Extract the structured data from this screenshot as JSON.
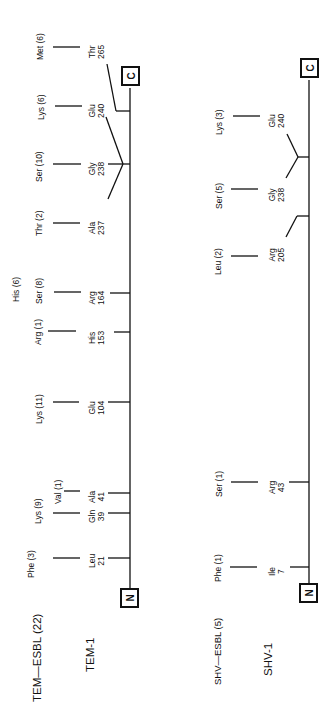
{
  "tem": {
    "group_label": "TEM—ESBL (22)",
    "protein_label": "TEM-1",
    "n_terminus": "N",
    "c_terminus": "C",
    "sites": [
      {
        "wild": "Leu",
        "pos": "21",
        "sub": "Phe (3)"
      },
      {
        "wild": "Gln",
        "pos": "39",
        "sub": "Lys (9)"
      },
      {
        "wild": "Ala",
        "pos": "41",
        "sub": "Val (1)"
      },
      {
        "wild": "Glu",
        "pos": "104",
        "sub": "Lys (11)"
      },
      {
        "wild": "His",
        "pos": "153",
        "sub": "Arg (1)"
      },
      {
        "wild": "Arg",
        "pos": "164",
        "sub": "Ser (8)",
        "sub2": "His (6)"
      },
      {
        "wild": "Ala",
        "pos": "237",
        "sub": "Thr (2)"
      },
      {
        "wild": "Gly",
        "pos": "238",
        "sub": "Ser (10)"
      },
      {
        "wild": "Glu",
        "pos": "240",
        "sub": "Lys (6)"
      },
      {
        "wild": "Thr",
        "pos": "265",
        "sub": "Met (6)"
      }
    ]
  },
  "shv": {
    "group_label": "SHV—ESBL (5)",
    "protein_label": "SHV-1",
    "n_terminus": "N",
    "c_terminus": "C",
    "sites": [
      {
        "wild": "Ile",
        "pos": "7",
        "sub": "Phe (1)"
      },
      {
        "wild": "Arg",
        "pos": "43",
        "sub": "Ser (1)"
      },
      {
        "wild": "Arg",
        "pos": "205",
        "sub": "Leu (2)"
      },
      {
        "wild": "Gly",
        "pos": "238",
        "sub": "Ser (5)"
      },
      {
        "wild": "Glu",
        "pos": "240",
        "sub": "Lys (3)"
      }
    ]
  }
}
